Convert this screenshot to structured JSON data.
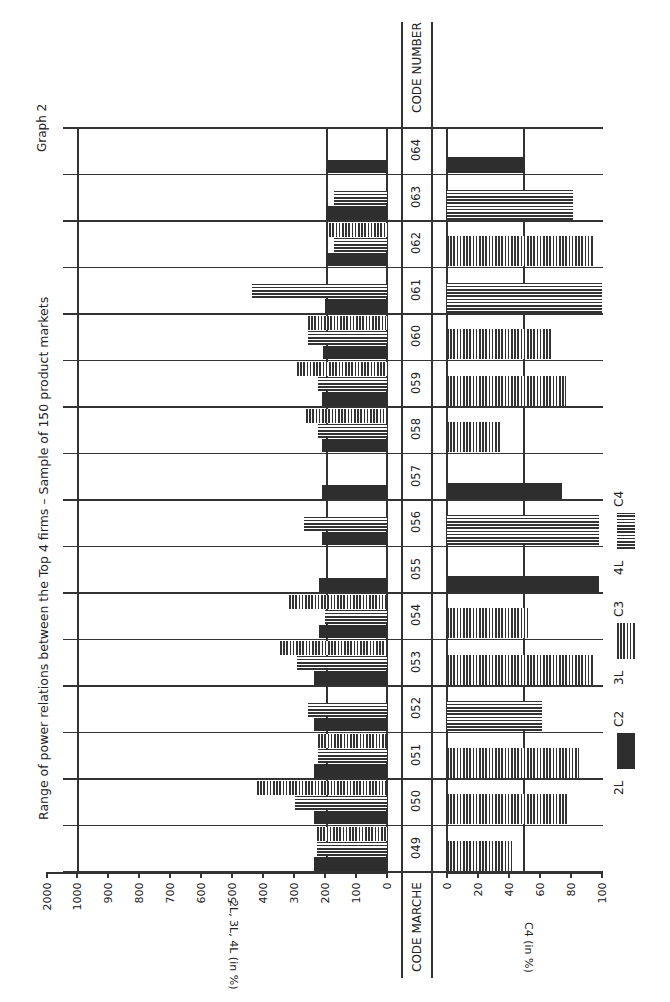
{
  "title": "Range of power relations between the Top 4 firms – Sample of 150 product markets",
  "graph_label": "Graph 2",
  "code_header_top": "CODE NUMBER",
  "code_header_bottom": "CODE MARCHE",
  "upper_axis_label": "2L, 3L, 4L (in %)",
  "lower_axis_label": "C4 (in %)",
  "upper_ticks": [
    "0",
    "100",
    "200",
    "300",
    "400",
    "500",
    "600",
    "700",
    "800",
    "900",
    "1000",
    "2000"
  ],
  "lower_ticks": [
    "0",
    "20",
    "40",
    "60",
    "80",
    "100"
  ],
  "legend": [
    {
      "key": "2L",
      "label": "C2",
      "pattern": "solid"
    },
    {
      "key": "3L",
      "label": "C3",
      "pattern": "vertical-hatch"
    },
    {
      "key": "4L",
      "label": "C4",
      "pattern": "horizontal-hatch"
    }
  ],
  "colors": {
    "ink": "#2e2e2e",
    "paper": "#ffffff"
  },
  "chart_data": [
    {
      "type": "bar",
      "orientation": "horizontal",
      "title": "Range of power relations between the Top 4 firms – Sample of 150 product markets",
      "xlabel": "2L, 3L, 4L (in %)",
      "ylabel": "CODE NUMBER",
      "xlim": [
        0,
        2000
      ],
      "axis_note": "non-linear: 0-1000 linear, then break to 2000",
      "categories": [
        "049",
        "050",
        "051",
        "052",
        "053",
        "054",
        "055",
        "056",
        "057",
        "058",
        "059",
        "060",
        "061",
        "062",
        "063",
        "064"
      ],
      "series": [
        {
          "name": "2L (C2)",
          "values": [
            235,
            235,
            235,
            235,
            235,
            220,
            220,
            210,
            210,
            210,
            210,
            205,
            200,
            197,
            197,
            195
          ]
        },
        {
          "name": "3L (C3)",
          "values": [
            225,
            420,
            222,
            null,
            345,
            316,
            null,
            null,
            null,
            260,
            290,
            255,
            null,
            197,
            null,
            null
          ]
        },
        {
          "name": "4L (C4)",
          "values": [
            225,
            297,
            222,
            255,
            290,
            200,
            null,
            268,
            null,
            222,
            222,
            255,
            435,
            170,
            170,
            null
          ]
        }
      ],
      "grid": true
    },
    {
      "type": "bar",
      "orientation": "horizontal",
      "xlabel": "C4 (in %)",
      "ylabel": "CODE MARCHE",
      "xlim": [
        0,
        100
      ],
      "categories": [
        "049",
        "050",
        "051",
        "052",
        "053",
        "054",
        "055",
        "056",
        "057",
        "058",
        "059",
        "060",
        "061",
        "062",
        "063",
        "064"
      ],
      "series": [
        {
          "name": "C4",
          "values": [
            42,
            79,
            85,
            61,
            95,
            52,
            98,
            98,
            74,
            35,
            77,
            68,
            100,
            95,
            81,
            50
          ],
          "pattern_by_category": [
            "3L",
            "3L",
            "3L",
            "4L",
            "3L",
            "3L",
            "2L",
            "4L",
            "2L",
            "3L",
            "3L",
            "3L",
            "4L",
            "3L",
            "4L",
            "2L"
          ]
        }
      ],
      "reference_line": 50
    }
  ]
}
